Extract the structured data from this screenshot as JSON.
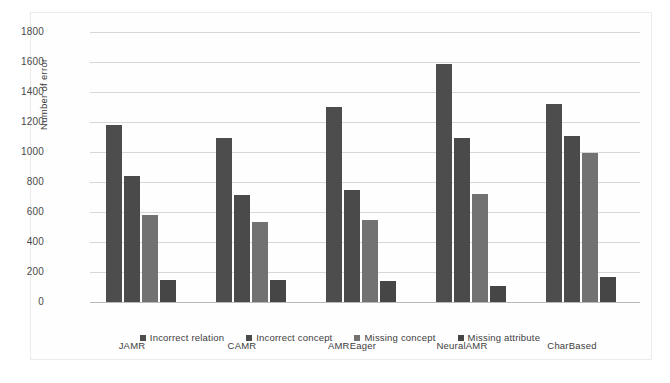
{
  "chart_data": {
    "type": "bar",
    "title": "",
    "xlabel": "",
    "ylabel": "Number of error",
    "ylim": [
      0,
      1800
    ],
    "ytick_step": 200,
    "yticks": [
      1800,
      1600,
      1400,
      1200,
      1000,
      800,
      600,
      400,
      200,
      0
    ],
    "grid": true,
    "legend_position": "bottom",
    "categories": [
      "JAMR",
      "CAMR",
      "AMREager",
      "NeuralAMR",
      "CharBased"
    ],
    "series": [
      {
        "name": "Incorrect relation",
        "color": "#4d4d4d",
        "values": [
          1180,
          1095,
          1300,
          1590,
          1320
        ]
      },
      {
        "name": "Incorrect concept",
        "color": "#4a4a4a",
        "values": [
          840,
          715,
          750,
          1095,
          1110
        ]
      },
      {
        "name": "Missing concept",
        "color": "#727272",
        "values": [
          580,
          535,
          550,
          720,
          995
        ]
      },
      {
        "name": "Missing attribute",
        "color": "#464646",
        "values": [
          150,
          148,
          140,
          110,
          165
        ]
      }
    ]
  }
}
